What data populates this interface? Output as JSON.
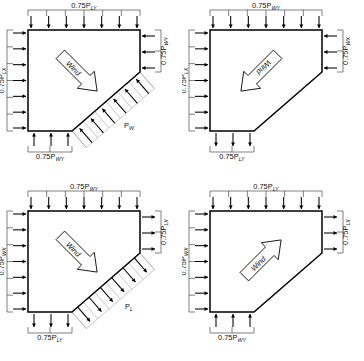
{
  "figure": {
    "name": "wind-load-distribution-pentagon-plans",
    "panel_count": 4,
    "wind_word": "Wind",
    "colors": {
      "outline": "#000000",
      "arrow": "#000000",
      "guide": "#9a9a9a",
      "background": "#ffffff"
    }
  },
  "panels": [
    {
      "id": "top-left",
      "wind_direction": "down-right",
      "diagonal_label": "P",
      "diagonal_sub": "W",
      "diagonal_mode": "pressure",
      "loads": {
        "top": {
          "prefix": "0.75P",
          "sub": "LY",
          "dir": "up"
        },
        "left": {
          "prefix": "0.75P",
          "sub": "LX",
          "dir": "right"
        },
        "right": {
          "prefix": "0.75P",
          "sub": "WY",
          "dir": "left"
        },
        "bottom": {
          "prefix": "0.75P",
          "sub": "WY",
          "dir": "up"
        }
      }
    },
    {
      "id": "top-right",
      "wind_direction": "down-left",
      "diagonal_label": "",
      "diagonal_sub": "",
      "diagonal_mode": "none",
      "loads": {
        "top": {
          "prefix": "0.75P",
          "sub": "WY",
          "dir": "down"
        },
        "left": {
          "prefix": "0.75P",
          "sub": "LX",
          "dir": "right"
        },
        "right": {
          "prefix": "0.75P",
          "sub": "WX",
          "dir": "left"
        },
        "bottom": {
          "prefix": "0.75P",
          "sub": "LY",
          "dir": "down"
        }
      }
    },
    {
      "id": "bottom-left",
      "wind_direction": "down-right",
      "diagonal_label": "P",
      "diagonal_sub": "L",
      "diagonal_mode": "suction",
      "loads": {
        "top": {
          "prefix": "0.75P",
          "sub": "WY",
          "dir": "down"
        },
        "left": {
          "prefix": "0.75P",
          "sub": "WX",
          "dir": "right"
        },
        "right": {
          "prefix": "0.75P",
          "sub": "LX",
          "dir": "right"
        },
        "bottom": {
          "prefix": "0.75P",
          "sub": "LY",
          "dir": "down"
        }
      }
    },
    {
      "id": "bottom-right",
      "wind_direction": "up-right",
      "diagonal_label": "",
      "diagonal_sub": "",
      "diagonal_mode": "none",
      "loads": {
        "top": {
          "prefix": "0.75P",
          "sub": "LY",
          "dir": "up"
        },
        "left": {
          "prefix": "0.75P",
          "sub": "WX",
          "dir": "right"
        },
        "right": {
          "prefix": "0.75P",
          "sub": "LX",
          "dir": "right"
        },
        "bottom": {
          "prefix": "0.75P",
          "sub": "WY",
          "dir": "up"
        }
      }
    }
  ]
}
